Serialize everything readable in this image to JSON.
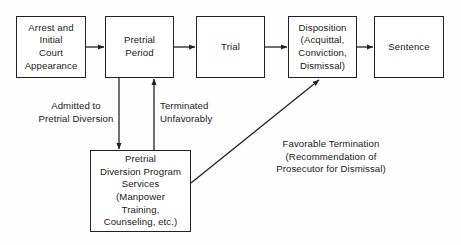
{
  "diagram": {
    "type": "flowchart",
    "colors": {
      "background": "#fefefe",
      "box_border": "#222222",
      "box_fill": "#ffffff",
      "line": "#222222",
      "text": "#1a1a1a"
    },
    "nodes": [
      {
        "id": "arrest",
        "label": "Arrest and\nInitial\nCourt\nAppearance"
      },
      {
        "id": "pretrial",
        "label": "Pretrial\nPeriod"
      },
      {
        "id": "trial",
        "label": "Trial"
      },
      {
        "id": "disposition",
        "label": "Disposition\n(Acquittal,\nConviction,\nDismissal)"
      },
      {
        "id": "sentence",
        "label": "Sentence"
      },
      {
        "id": "diversion",
        "label": "Pretrial\nDiversion Program\nServices\n(Manpower\nTraining,\nCounseling, etc.)"
      }
    ],
    "edge_labels": [
      {
        "id": "admitted",
        "label": "Admitted  to\nPretrial Diversion"
      },
      {
        "id": "terminated",
        "label": "Terminated\nUnfavorably"
      },
      {
        "id": "favorable",
        "label": "Favorable Termination\n(Recommendation of\nProsecutor for Dismissal)"
      }
    ],
    "edges": [
      {
        "id": "arrest-to-pretrial",
        "from": "arrest",
        "to": "pretrial",
        "style": "straight-horizontal"
      },
      {
        "id": "pretrial-to-trial",
        "from": "pretrial",
        "to": "trial",
        "style": "straight-horizontal"
      },
      {
        "id": "trial-to-disposition",
        "from": "trial",
        "to": "disposition",
        "style": "straight-horizontal"
      },
      {
        "id": "disposition-to-sentence",
        "from": "disposition",
        "to": "sentence",
        "style": "straight-horizontal"
      },
      {
        "id": "pretrial-to-diversion",
        "from": "pretrial",
        "to": "diversion",
        "style": "vertical-down",
        "label": "admitted"
      },
      {
        "id": "diversion-to-pretrial",
        "from": "diversion",
        "to": "pretrial",
        "style": "vertical-up",
        "label": "terminated"
      },
      {
        "id": "diversion-to-disposition",
        "from": "diversion",
        "to": "disposition",
        "style": "diagonal",
        "label": "favorable"
      }
    ]
  }
}
